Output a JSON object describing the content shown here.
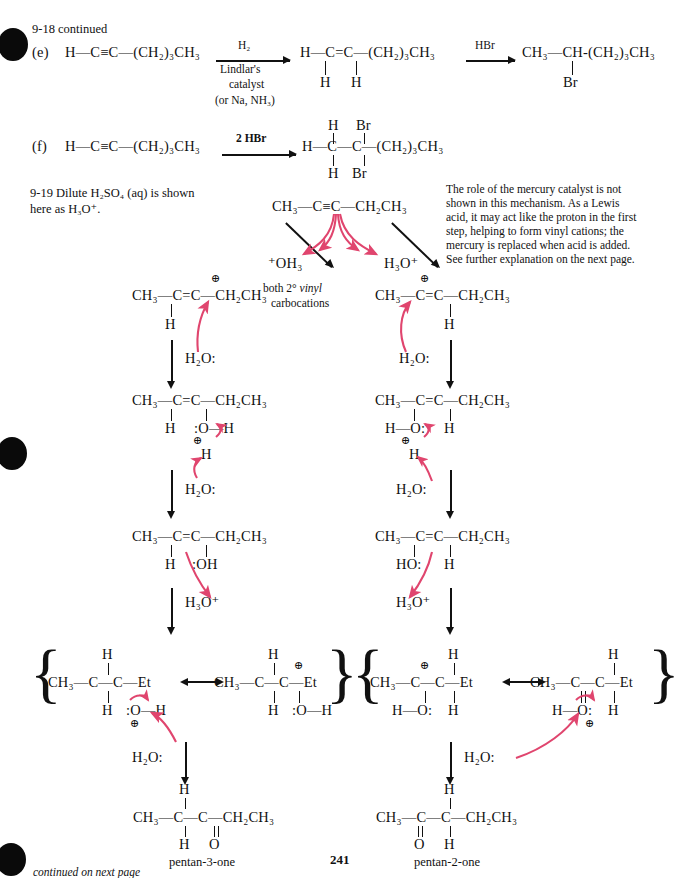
{
  "page": {
    "number": "241",
    "footer_note": "continued on next page",
    "header": "9-18  continued"
  },
  "problem_9_18": {
    "part_e": {
      "label": "(e)",
      "reactant": "H—C≡C—(CH₂)₃CH₃",
      "reagent_top": "H₂",
      "reagent_lines": [
        "Lindlar's",
        "catalyst",
        "(or Na, NH₃)"
      ],
      "product1": "H—C=C—(CH₂)₃CH₃",
      "product1_subs": [
        "H",
        "H"
      ],
      "reagent2": "HBr",
      "product2": "CH₃—CH-(CH₂)₃CH₃",
      "product2_sub": "Br"
    },
    "part_f": {
      "label": "(f)",
      "reactant": "H—C≡C—(CH₂)₃CH₃",
      "reagent": "2 HBr",
      "product_top": [
        "H",
        "Br"
      ],
      "product_mid": "H—C—C—(CH₂)₃CH₃",
      "product_bot": [
        "H",
        "Br"
      ]
    }
  },
  "problem_9_19": {
    "label": "9-19  Dilute H₂SO₄ (aq) is shown",
    "label_line2": "here as H₃O⁺.",
    "annotation": "The role of the mercury catalyst is not shown in this mechanism.  As a Lewis acid, it may act like the proton in the first step, helping to form vinyl cations; the mercury is replaced when acid is added. See further explanation on the next page.",
    "annotation_lines": [
      "The role of the mercury catalyst is not",
      "shown in this mechanism.  As a Lewis",
      "acid, it may act like the proton in the first",
      "step, helping to form vinyl cations; the",
      "mercury is replaced when acid is added.",
      "See further explanation on the next page."
    ],
    "starting_material": "CH₃—C≡C—CH₂CH₃",
    "reagent_left": "⁺OH₃",
    "reagent_right": "H₃O⁺",
    "center_note_line1": "both 2° vinyl",
    "center_note_line2": "carbocations",
    "center_note_italic_word": "vinyl",
    "left_branch": {
      "cation": "CH₃—C=C—CH₂CH₃",
      "cation_sub": "H",
      "cation_charge": "⊕",
      "nucleophile": "H₂O:",
      "oxonium_main": "CH₃—C=C—CH₂CH₃",
      "oxonium_subs": [
        "H",
        ":O—H"
      ],
      "oxonium_charge": "⊕",
      "oxonium_h": "H",
      "base": "H₂O:",
      "enol_main": "CH₃—C=C—CH₂CH₃",
      "enol_subs": [
        "H",
        ":OH"
      ],
      "acid": "H₃O⁺",
      "resonance_a": {
        "top": "H",
        "main": "CH₃—C—C—Et",
        "bot_left": "H",
        "bot_right": ":O—H",
        "charge": "⊕"
      },
      "resonance_b": {
        "top": "H",
        "main": "CH₃—C—C—Et",
        "bot_left": "H",
        "bot_right": ":O—H",
        "charge": "⊕"
      },
      "final_base": "H₂O:",
      "product_top": "H",
      "product_main": "CH₃—C—C—CH₂CH₃",
      "product_bot": [
        "H",
        "O"
      ],
      "product_name": "pentan-3-one"
    },
    "right_branch": {
      "cation": "CH₃—C=C—CH₂CH₃",
      "cation_sub": "H",
      "cation_charge": "⊕",
      "nucleophile": "H₂O:",
      "oxonium_main": "CH₃—C=C—CH₂CH₃",
      "oxonium_subs": [
        "H—O:",
        "H"
      ],
      "oxonium_charge": "⊕",
      "oxonium_h": "H",
      "base": "H₂O:",
      "enol_main": "CH₃—C=C—CH₂CH₃",
      "enol_subs": [
        "HO:",
        "H"
      ],
      "acid": "H₃O⁺",
      "resonance_a": {
        "top": "H",
        "main": "CH₃—C—C—Et",
        "bot_left": "H—O:",
        "bot_right": "H",
        "charge": "⊕"
      },
      "resonance_b": {
        "top": "H",
        "main": "CH₃—C—C—Et",
        "bot_left": "H—O:",
        "bot_right": "H",
        "charge": "⊕"
      },
      "final_base": "H₂O:",
      "product_top": "H",
      "product_main": "CH₃—C—C—CH₂CH₃",
      "product_bot": [
        "O",
        "H"
      ],
      "product_name": "pentan-2-one"
    }
  },
  "colors": {
    "arrow_pink": "#e0456e",
    "ink": "#111111",
    "page_bg": "#ffffff"
  },
  "resonance_arrow": "⟷"
}
